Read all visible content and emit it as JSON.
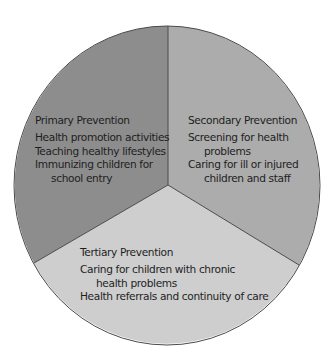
{
  "diagram": {
    "type": "pie-diagram",
    "colors": {
      "primary": "#8d8d8d",
      "secondary": "#acacac",
      "tertiary": "#cecece",
      "outline": "#4a4a4a"
    },
    "sections": {
      "primary": {
        "title": "Primary Prevention",
        "items": [
          "Health promotion activities",
          "Teaching healthy lifestyles",
          "Immunizing children for",
          "school entry"
        ]
      },
      "secondary": {
        "title": "Secondary Prevention",
        "items": [
          "Screening for health",
          "problems",
          "Caring for ill or injured",
          "children and staff"
        ]
      },
      "tertiary": {
        "title": "Tertiary Prevention",
        "items": [
          "Caring for children with chronic",
          "health problems",
          "Health referrals and continuity of care"
        ]
      }
    }
  }
}
